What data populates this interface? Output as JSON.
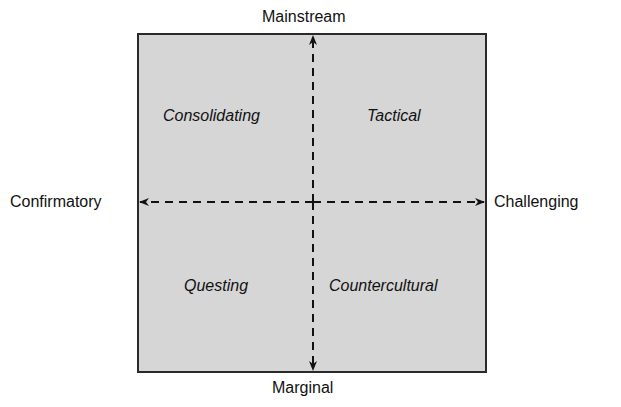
{
  "diagram": {
    "type": "quadrant",
    "axes": {
      "top": "Mainstream",
      "bottom": "Marginal",
      "left": "Confirmatory",
      "right": "Challenging"
    },
    "quadrants": {
      "top_left": "Consolidating",
      "top_right": "Tactical",
      "bottom_left": "Questing",
      "bottom_right": "Countercultural"
    },
    "colors": {
      "box_fill": "#d6d6d6",
      "border": "#2a2a2a",
      "arrows": "#111111"
    }
  }
}
